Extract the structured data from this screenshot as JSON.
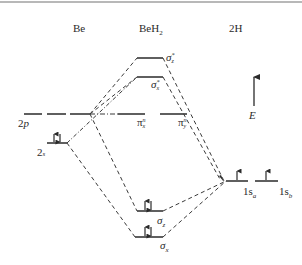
{
  "columns": {
    "left": "Be",
    "center": "BeH",
    "center_sub": "2",
    "right": "2H"
  },
  "axis": {
    "label": "E"
  },
  "levels": {
    "be_2p": {
      "label": "2",
      "label_it": "p"
    },
    "be_2s": {
      "label": "2",
      "label_it": "s",
      "electrons": "↑↓"
    },
    "sigma_z_star": {
      "symbol": "σ",
      "sub": "z",
      "sup": "*"
    },
    "sigma_x_star": {
      "symbol": "σ",
      "sub": "x",
      "sup": "*"
    },
    "pi_x_n": {
      "symbol": "π",
      "sub": "x",
      "sup": "n"
    },
    "pi_y_n": {
      "symbol": "π",
      "sub": "y",
      "sup": "n"
    },
    "sigma_z": {
      "symbol": "σ",
      "sub": "z",
      "electrons": "↑↓"
    },
    "sigma_x": {
      "symbol": "σ",
      "sub": "x",
      "electrons": "↑↓"
    },
    "h_1sa": {
      "label": "1s",
      "sub": "a",
      "electrons": "↑"
    },
    "h_1sb": {
      "label": "1s",
      "sub": "b",
      "electrons": "↑"
    }
  },
  "colors": {
    "line": "#2a2a2a",
    "dash": "#3a3a3a",
    "top_rule": "#b8b8b8"
  }
}
